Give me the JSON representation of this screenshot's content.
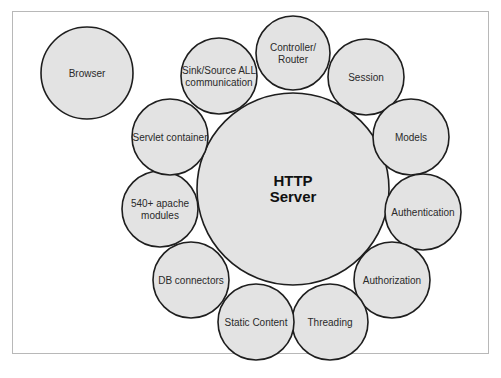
{
  "diagram": {
    "center": {
      "label_lines": [
        "HTTP",
        "Server"
      ],
      "cx": 293,
      "cy": 189,
      "r": 96
    },
    "nodes": [
      {
        "id": "browser",
        "label_lines": [
          "Browser"
        ],
        "cx": 87,
        "cy": 73,
        "r": 46
      },
      {
        "id": "sink-source",
        "label_lines": [
          "Sink/Source ALL",
          "communication"
        ],
        "cx": 219,
        "cy": 76,
        "r": 38
      },
      {
        "id": "controller-router",
        "label_lines": [
          "Controller/",
          "Router"
        ],
        "cx": 293,
        "cy": 53,
        "r": 37
      },
      {
        "id": "session",
        "label_lines": [
          "Session"
        ],
        "cx": 366,
        "cy": 77,
        "r": 38
      },
      {
        "id": "models",
        "label_lines": [
          "Models"
        ],
        "cx": 411,
        "cy": 137,
        "r": 38
      },
      {
        "id": "authentication",
        "label_lines": [
          "Authentication"
        ],
        "cx": 423,
        "cy": 212,
        "r": 38
      },
      {
        "id": "authorization",
        "label_lines": [
          "Authorization"
        ],
        "cx": 392,
        "cy": 280,
        "r": 38
      },
      {
        "id": "threading",
        "label_lines": [
          "Threading"
        ],
        "cx": 330,
        "cy": 322,
        "r": 38
      },
      {
        "id": "static-content",
        "label_lines": [
          "Static Content"
        ],
        "cx": 256,
        "cy": 322,
        "r": 38
      },
      {
        "id": "db-connectors",
        "label_lines": [
          "DB connectors"
        ],
        "cx": 191,
        "cy": 280,
        "r": 38
      },
      {
        "id": "apache-modules",
        "label_lines": [
          "540+ apache",
          "modules"
        ],
        "cx": 160,
        "cy": 209,
        "r": 38
      },
      {
        "id": "servlet-container",
        "label_lines": [
          "Servlet container"
        ],
        "cx": 170,
        "cy": 137,
        "r": 38
      }
    ],
    "colors": {
      "fill": "#e3e3e3",
      "stroke": "#1e1e1e",
      "text": "#2a2a2a"
    }
  }
}
